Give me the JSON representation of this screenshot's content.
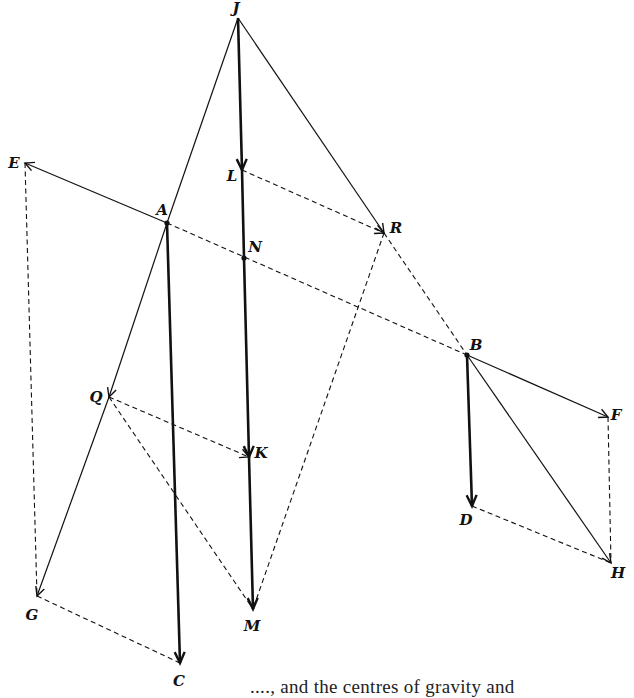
{
  "figure": {
    "caption_fragment": "...., and the centres of gravity and",
    "points": {
      "J": {
        "x": 238,
        "y": 18,
        "label": "J",
        "lx": 236,
        "ly": 8
      },
      "L": {
        "x": 242,
        "y": 170,
        "label": "L",
        "lx": 232,
        "ly": 176
      },
      "A": {
        "x": 167,
        "y": 223,
        "label": "A",
        "lx": 162,
        "ly": 210
      },
      "E": {
        "x": 25,
        "y": 163,
        "label": "E",
        "lx": 14,
        "ly": 163
      },
      "R": {
        "x": 384,
        "y": 233,
        "label": "R",
        "lx": 396,
        "ly": 228
      },
      "N": {
        "x": 244,
        "y": 258,
        "label": "N",
        "lx": 255,
        "ly": 247
      },
      "B": {
        "x": 467,
        "y": 355,
        "label": "B",
        "lx": 476,
        "ly": 345
      },
      "F": {
        "x": 608,
        "y": 417,
        "label": "F",
        "lx": 616,
        "ly": 415
      },
      "Q": {
        "x": 109,
        "y": 397,
        "label": "Q",
        "lx": 96,
        "ly": 397
      },
      "K": {
        "x": 249,
        "y": 457,
        "label": "K",
        "lx": 261,
        "ly": 453
      },
      "D": {
        "x": 472,
        "y": 506,
        "label": "D",
        "lx": 466,
        "ly": 520
      },
      "H": {
        "x": 611,
        "y": 563,
        "label": "H",
        "lx": 618,
        "ly": 573
      },
      "G": {
        "x": 37,
        "y": 596,
        "label": "G",
        "lx": 32,
        "ly": 615
      },
      "M": {
        "x": 253,
        "y": 609,
        "label": "M",
        "lx": 252,
        "ly": 626
      },
      "C": {
        "x": 180,
        "y": 663,
        "label": "C",
        "lx": 179,
        "ly": 681
      }
    },
    "segments": [
      {
        "from": "J",
        "to": "L",
        "style": "thick",
        "arrow": true
      },
      {
        "from": "L",
        "to": "N",
        "style": "thick",
        "arrow": false
      },
      {
        "from": "N",
        "to": "K",
        "style": "thick",
        "arrow": true
      },
      {
        "from": "K",
        "to": "M",
        "style": "thick",
        "arrow": true
      },
      {
        "from": "A",
        "to": "C",
        "style": "thick",
        "arrow": true
      },
      {
        "from": "B",
        "to": "D",
        "style": "thick",
        "arrow": true
      },
      {
        "from": "J",
        "to": "A",
        "style": "thin",
        "arrow": false
      },
      {
        "from": "A",
        "to": "Q",
        "style": "thin",
        "arrow": true
      },
      {
        "from": "Q",
        "to": "G",
        "style": "thin",
        "arrow": true
      },
      {
        "from": "J",
        "to": "R",
        "style": "thin",
        "arrow": true
      },
      {
        "from": "A",
        "to": "E",
        "style": "thin",
        "arrow": true
      },
      {
        "from": "B",
        "to": "F",
        "style": "thin",
        "arrow": true
      },
      {
        "from": "B",
        "to": "H",
        "style": "thin",
        "arrow": true
      },
      {
        "from": "L",
        "to": "R",
        "style": "dashed",
        "arrow": true
      },
      {
        "from": "A",
        "to": "B",
        "style": "dashed",
        "arrow": false
      },
      {
        "from": "R",
        "to": "B",
        "style": "dashed",
        "arrow": false
      },
      {
        "from": "R",
        "to": "M",
        "style": "dashed",
        "arrow": false
      },
      {
        "from": "Q",
        "to": "K",
        "style": "dashed",
        "arrow": true
      },
      {
        "from": "Q",
        "to": "M",
        "style": "dashed",
        "arrow": false
      },
      {
        "from": "E",
        "to": "G",
        "style": "dashed",
        "arrow": false
      },
      {
        "from": "G",
        "to": "C",
        "style": "dashed",
        "arrow": false
      },
      {
        "from": "F",
        "to": "H",
        "style": "dashed",
        "arrow": false
      },
      {
        "from": "D",
        "to": "H",
        "style": "dashed",
        "arrow": false
      }
    ],
    "dots": [
      "A",
      "N",
      "B"
    ]
  }
}
